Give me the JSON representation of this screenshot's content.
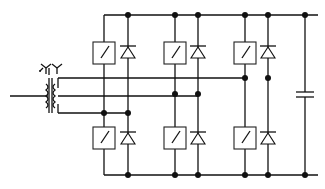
{
  "diagram": {
    "colors": {
      "line": "#111111",
      "background": "#ffffff"
    },
    "components": {
      "transformer": {
        "label": ""
      },
      "switches": [
        "S1",
        "S2",
        "S3",
        "S4",
        "S5",
        "S6"
      ],
      "diodes": [
        "D1",
        "D2",
        "D3",
        "D4",
        "D5",
        "D6"
      ],
      "capacitor": {
        "label": ""
      }
    }
  }
}
